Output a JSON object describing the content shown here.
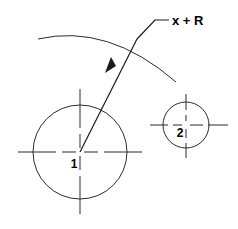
{
  "diagram": {
    "colors": {
      "line": "#2b2b2b",
      "text": "#000000",
      "background": "#ffffff"
    },
    "labels": {
      "dimension": "x + R",
      "circle_one": "1",
      "circle_two": "2"
    },
    "shapes": {
      "circle_one": {
        "name": "large-circle",
        "cx": 80,
        "cy": 152,
        "r": 47
      },
      "circle_two": {
        "name": "small-circle",
        "cx": 186,
        "cy": 125,
        "r": 23
      },
      "arc": {
        "name": "reference-arc",
        "start_x": 38,
        "start_y": 39,
        "end_x": 176,
        "end_y": 82
      },
      "arrow": {
        "name": "radius-arrow",
        "from_x": 80,
        "from_y": 152,
        "to_x": 137,
        "to_y": 38
      },
      "leader": {
        "name": "leader-line",
        "elbow_x": 155,
        "elbow_y": 20,
        "end_x": 168,
        "end_y": 20
      }
    }
  }
}
